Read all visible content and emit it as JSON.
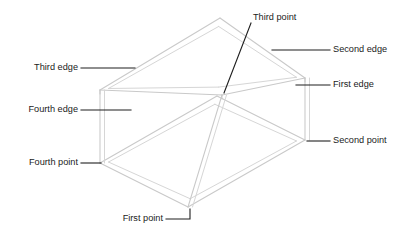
{
  "diagram": {
    "type": "isometric-box-wireframe",
    "canvas": {
      "width": 399,
      "height": 230
    },
    "colors": {
      "background": "#ffffff",
      "wireframe_line": "#c9c9c9",
      "wireframe_line_inner": "#d6d6d6",
      "leader_line": "#1f1f1f",
      "label_text": "#1b1b1b"
    },
    "geometry": {
      "outer": {
        "top_back": {
          "x": 220,
          "y": 18
        },
        "top_left": {
          "x": 100,
          "y": 90
        },
        "top_front": {
          "x": 222,
          "y": 95
        },
        "top_right": {
          "x": 305,
          "y": 78
        },
        "bottom_left": {
          "x": 100,
          "y": 163
        },
        "bottom_front": {
          "x": 188,
          "y": 207
        },
        "bottom_right": {
          "x": 305,
          "y": 140
        }
      },
      "inset": 4.5,
      "slab_depth": 4
    }
  },
  "labels": [
    {
      "id": "third-point",
      "text": "Third point",
      "text_x": 253,
      "text_y": 18,
      "anchor": "start",
      "leader": [
        {
          "x": 251,
          "y": 23
        },
        {
          "x": 224,
          "y": 93
        }
      ]
    },
    {
      "id": "second-edge",
      "text": "Second edge",
      "text_x": 333,
      "text_y": 50,
      "anchor": "start",
      "leader": [
        {
          "x": 330,
          "y": 50
        },
        {
          "x": 272,
          "y": 50
        }
      ]
    },
    {
      "id": "first-edge",
      "text": "First edge",
      "text_x": 333,
      "text_y": 85,
      "anchor": "start",
      "leader": [
        {
          "x": 330,
          "y": 85
        },
        {
          "x": 296,
          "y": 85
        }
      ]
    },
    {
      "id": "second-point",
      "text": "Second point",
      "text_x": 333,
      "text_y": 141,
      "anchor": "start",
      "leader": [
        {
          "x": 330,
          "y": 141
        },
        {
          "x": 307,
          "y": 141
        }
      ]
    },
    {
      "id": "third-edge",
      "text": "Third edge",
      "text_x": 78,
      "text_y": 68,
      "anchor": "end",
      "leader": [
        {
          "x": 81,
          "y": 68
        },
        {
          "x": 135,
          "y": 68
        }
      ]
    },
    {
      "id": "fourth-edge",
      "text": "Fourth edge",
      "text_x": 78,
      "text_y": 110,
      "anchor": "end",
      "leader": [
        {
          "x": 81,
          "y": 110
        },
        {
          "x": 131,
          "y": 110
        }
      ]
    },
    {
      "id": "fourth-point",
      "text": "Fourth point",
      "text_x": 78,
      "text_y": 163,
      "anchor": "end",
      "leader": [
        {
          "x": 81,
          "y": 163
        },
        {
          "x": 101,
          "y": 163
        }
      ]
    },
    {
      "id": "first-point",
      "text": "First point",
      "text_x": 163,
      "text_y": 219,
      "anchor": "end",
      "leader": [
        {
          "x": 166,
          "y": 219
        },
        {
          "x": 190,
          "y": 219
        },
        {
          "x": 190,
          "y": 209
        }
      ]
    }
  ]
}
